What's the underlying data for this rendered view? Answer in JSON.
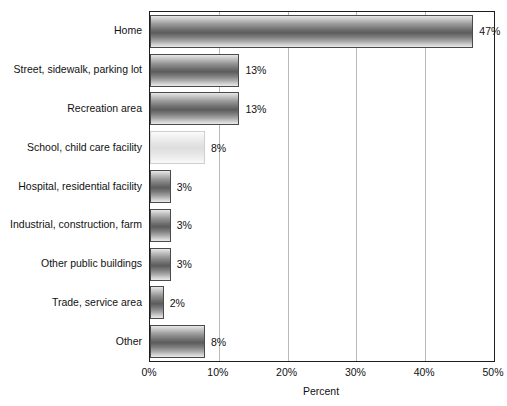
{
  "chart_data": {
    "type": "bar",
    "orientation": "horizontal",
    "title": "",
    "subtitle": "",
    "xlabel": "Percent",
    "ylabel": "",
    "xlim": [
      0,
      50
    ],
    "xtick_labels": [
      "0%",
      "10%",
      "20%",
      "30%",
      "40%",
      "50%"
    ],
    "xticks": [
      0,
      10,
      20,
      30,
      40,
      50
    ],
    "grid": "vertical",
    "legend": "none",
    "categories": [
      "Home",
      "Street, sidewalk, parking lot",
      "Recreation area",
      "School, child care facility",
      "Hospital, residential facility",
      "Industrial, construction, farm",
      "Other public buildings",
      "Trade, service area",
      "Other"
    ],
    "values": [
      47,
      13,
      13,
      8,
      3,
      3,
      3,
      2,
      8
    ],
    "data_labels": [
      "47%",
      "13%",
      "13%",
      "8%",
      "3%",
      "3%",
      "3%",
      "2%",
      "8%"
    ],
    "bar_styles": [
      "dark",
      "dark",
      "dark",
      "light",
      "dark",
      "dark",
      "dark",
      "dark",
      "dark"
    ]
  },
  "colors": {
    "background": "#ffffff",
    "axis": "#1d1d1d",
    "gridline": "#b9b9b9",
    "bar_dark_mid": "#5c5c5c",
    "bar_light_mid": "#dedede",
    "text": "#111111"
  }
}
